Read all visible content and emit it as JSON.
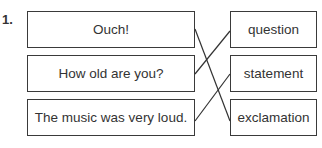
{
  "exercise": {
    "number": "1.",
    "left_items": [
      {
        "label": "Ouch!"
      },
      {
        "label": "How old are you?"
      },
      {
        "label": "The music was very loud."
      }
    ],
    "right_items": [
      {
        "label": "question"
      },
      {
        "label": "statement"
      },
      {
        "label": "exclamation"
      }
    ],
    "matches": [
      {
        "from": "Ouch!",
        "to": "exclamation"
      },
      {
        "from": "How old are you?",
        "to": "question"
      },
      {
        "from": "The music was very loud.",
        "to": "statement"
      }
    ]
  }
}
